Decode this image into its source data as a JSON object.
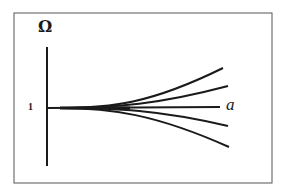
{
  "figure": {
    "y_axis_label": "Ω",
    "x_axis_label": "a",
    "y_tick_label": "1",
    "colors": {
      "line": "#1a1a1a",
      "frame": "#555555",
      "background": "#ffffff"
    },
    "curves": [
      {
        "name": "upper-outer",
        "direction": "up"
      },
      {
        "name": "upper-inner",
        "direction": "up"
      },
      {
        "name": "center",
        "direction": "flat"
      },
      {
        "name": "lower-inner",
        "direction": "down"
      },
      {
        "name": "lower-outer",
        "direction": "down"
      }
    ]
  }
}
